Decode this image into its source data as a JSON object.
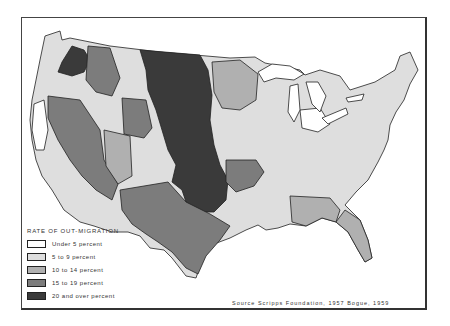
{
  "map": {
    "subject": "Rate of out-migration by state economic area, United States",
    "legend": {
      "title": "RATE OF OUT-MIGRATION",
      "items": [
        {
          "label": "Under 5 percent",
          "fill": "#ffffff"
        },
        {
          "label": "5 to 9 percent",
          "fill": "#dedede"
        },
        {
          "label": "10 to 14 percent",
          "fill": "#b0b0b0"
        },
        {
          "label": "15 to 19 percent",
          "fill": "#7c7c7c"
        },
        {
          "label": "20 and over percent",
          "fill": "#3a3a3a"
        }
      ]
    },
    "source": "Source  Scripps Foundation, 1957  Bogue, 1959",
    "colors": {
      "lt5": "#ffffff",
      "c5_9": "#dedede",
      "c10_14": "#b0b0b0",
      "c15_19": "#7c7c7c",
      "c20plus": "#3a3a3a",
      "border": "#222222"
    }
  }
}
